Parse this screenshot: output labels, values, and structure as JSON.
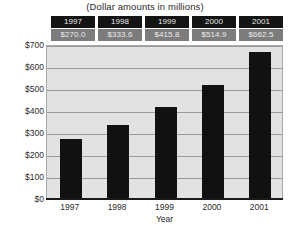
{
  "chart_data": {
    "type": "bar",
    "title": "(Dollar amounts in millions)",
    "xlabel": "Year",
    "ylabel": "",
    "categories": [
      "1997",
      "1998",
      "1999",
      "2000",
      "2001"
    ],
    "values": [
      270.0,
      333.6,
      415.8,
      514.9,
      662.5
    ],
    "value_labels": [
      "$270.0",
      "$333.6",
      "$415.8",
      "$514.9",
      "$662.5"
    ],
    "ylim": [
      0,
      700
    ],
    "y_ticks": [
      0,
      100,
      200,
      300,
      400,
      500,
      600,
      700
    ],
    "y_tick_labels": [
      "$0",
      "$100",
      "$200",
      "$300",
      "$400",
      "$500",
      "$600",
      "$700"
    ],
    "grid": true,
    "legend": false,
    "bar_color": "#111111",
    "plot_background": "#e2e2e2",
    "gridline_color": "#9a9a9a"
  },
  "data_table": {
    "header_row": [
      "1997",
      "1998",
      "1999",
      "2000",
      "2001"
    ],
    "value_row": [
      "$270.0",
      "$333.6",
      "$415.8",
      "$514.9",
      "$662.5"
    ],
    "header_background": "#141414",
    "value_background": "#7c7c7c"
  }
}
